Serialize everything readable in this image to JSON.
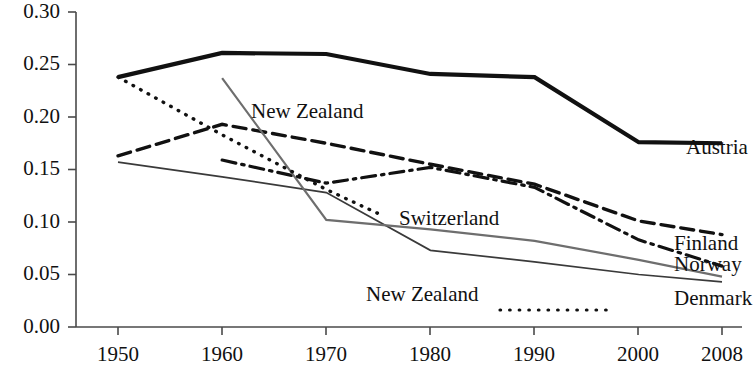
{
  "chart_data": {
    "type": "line",
    "title": "",
    "xlabel": "",
    "ylabel": "",
    "x": [
      1950,
      1960,
      1970,
      1980,
      1990,
      2000,
      2008
    ],
    "categories": [
      "1950",
      "1960",
      "1970",
      "1980",
      "1990",
      "2000",
      "2008"
    ],
    "xtick_labels": [
      "1950",
      "1960",
      "1970",
      "1980",
      "1990",
      "2000",
      "2008"
    ],
    "ytick_labels": [
      "0.00",
      "0.05",
      "0.10",
      "0.15",
      "0.20",
      "0.25",
      "0.30"
    ],
    "ytick_values": [
      0.0,
      0.05,
      0.1,
      0.15,
      0.2,
      0.25,
      0.3
    ],
    "ylim": [
      0.0,
      0.3
    ],
    "xlim": [
      1950,
      2008
    ],
    "grid": false,
    "legend_position": "right-inline",
    "series": [
      {
        "name": "Austria",
        "style": "solid-thick",
        "color": "#111111",
        "x": [
          1950,
          1960,
          1970,
          1980,
          1990,
          2000,
          2008
        ],
        "values": [
          0.238,
          0.261,
          0.26,
          0.241,
          0.238,
          0.176,
          0.175
        ],
        "label_position": "right"
      },
      {
        "name": "Finland",
        "style": "dashed",
        "color": "#111111",
        "x": [
          1950,
          1960,
          1970,
          1980,
          1990,
          2000,
          2008
        ],
        "values": [
          0.163,
          0.193,
          0.175,
          0.155,
          0.136,
          0.101,
          0.088
        ],
        "label_position": "right"
      },
      {
        "name": "Norway",
        "style": "dash-dot",
        "color": "#111111",
        "x": [
          1960,
          1970,
          1980,
          1990,
          2000,
          2008
        ],
        "values": [
          0.159,
          0.137,
          0.152,
          0.133,
          0.083,
          0.058
        ],
        "label_position": "right"
      },
      {
        "name": "Denmark",
        "style": "solid-thin",
        "color": "#3a3a3a",
        "x": [
          1950,
          1960,
          1970,
          1980,
          1990,
          2000,
          2008
        ],
        "values": [
          0.157,
          0.143,
          0.128,
          0.073,
          0.062,
          0.05,
          0.043
        ],
        "label_position": "right"
      },
      {
        "name": "Switzerland",
        "style": "solid-thin-grey",
        "color": "#6e6e6e",
        "x": [
          1960,
          1970,
          1980,
          1990,
          2000,
          2008
        ],
        "values": [
          0.237,
          0.102,
          0.093,
          0.082,
          0.064,
          0.048
        ],
        "label_position": "inline"
      },
      {
        "name": "New Zealand",
        "style": "dotted",
        "color": "#111111",
        "x": [
          1950,
          1960,
          1970,
          1975
        ],
        "values": [
          0.238,
          0.183,
          0.131,
          0.108
        ],
        "label_position": "inline"
      }
    ]
  },
  "labels": {
    "austria": "Austria",
    "finland": "Finland",
    "norway": "Norway",
    "denmark": "Denmark",
    "switzerland": "Switzerland",
    "new_zealand_inline": "New Zealand",
    "new_zealand_legend": "New Zealand"
  },
  "axis": {
    "y_ticks": [
      "0.30",
      "0.25",
      "0.20",
      "0.15",
      "0.10",
      "0.05",
      "0.00"
    ],
    "x_ticks": [
      "1950",
      "1960",
      "1970",
      "1980",
      "1990",
      "2000",
      "2008"
    ]
  },
  "colors": {
    "axis": "#4a4a4a",
    "ink": "#111111",
    "grey_series": "#6e6e6e",
    "thin_series": "#3a3a3a",
    "background": "#ffffff"
  }
}
